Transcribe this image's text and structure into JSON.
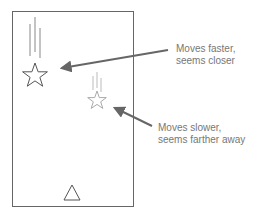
{
  "diagram": {
    "frame": {
      "x": 12,
      "y": 11,
      "width": 122,
      "height": 196,
      "stroke": "#666666"
    },
    "objects": [
      {
        "name": "near-star",
        "shape": "star",
        "cx": 35,
        "cy": 76,
        "r": 12,
        "stroke": "#555555",
        "motion_lines": 3,
        "motion_line_color": "#888888"
      },
      {
        "name": "far-star",
        "shape": "star",
        "cx": 97,
        "cy": 100,
        "r": 9,
        "stroke": "#aaaaaa",
        "motion_lines": 3,
        "motion_line_color": "#bbbbbb"
      },
      {
        "name": "triangle",
        "shape": "triangle",
        "cx": 72,
        "cy": 193,
        "size": 14,
        "stroke": "#555555"
      }
    ],
    "annotations": [
      {
        "id": "fast",
        "lines": [
          "Moves faster,",
          "seems closer"
        ],
        "arrow_color": "#666666"
      },
      {
        "id": "slow",
        "lines": [
          "Moves slower,",
          "seems farther away"
        ],
        "arrow_color": "#666666"
      }
    ]
  }
}
